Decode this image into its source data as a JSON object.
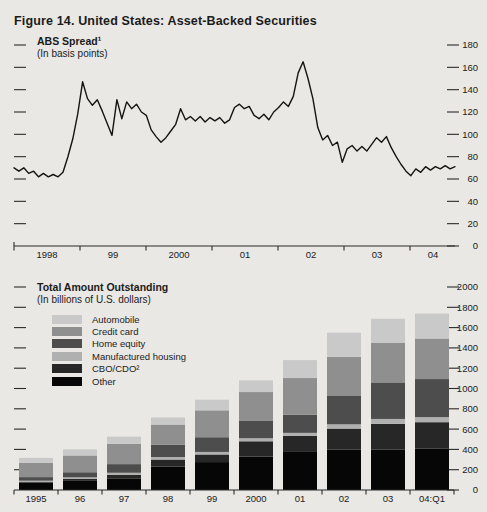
{
  "figure_title": "Figure 14. United States: Asset-Backed Securities",
  "colors": {
    "paper": "#e9e8e4",
    "ink": "#1b1b1b",
    "axis": "#2a2a2a"
  },
  "chart_data": [
    {
      "type": "line",
      "title": "ABS Spread¹",
      "subtitle": "(In basis points)",
      "x_axis": {
        "tick_labels": [
          "1998",
          "99",
          "2000",
          "01",
          "02",
          "03",
          "04"
        ]
      },
      "y_axis": {
        "side": "right",
        "ticks": [
          0,
          20,
          40,
          60,
          80,
          100,
          120,
          140,
          160,
          180
        ],
        "ylim": [
          0,
          180
        ],
        "grid": false
      },
      "series": [
        {
          "name": "ABS spread (basis points)",
          "color": "#141414",
          "values": [
            70,
            67,
            70,
            65,
            67,
            62,
            65,
            62,
            64,
            62,
            66,
            80,
            96,
            118,
            147,
            132,
            126,
            131,
            121,
            110,
            99,
            131,
            114,
            129,
            123,
            127,
            120,
            117,
            104,
            98,
            93,
            97,
            103,
            109,
            123,
            113,
            116,
            112,
            116,
            111,
            115,
            112,
            115,
            110,
            113,
            124,
            127,
            123,
            125,
            117,
            114,
            118,
            113,
            120,
            124,
            129,
            125,
            134,
            155,
            165,
            150,
            132,
            106,
            95,
            99,
            90,
            93,
            75,
            87,
            90,
            85,
            89,
            85,
            91,
            97,
            93,
            98,
            88,
            80,
            73,
            67,
            63,
            69,
            66,
            71,
            68,
            71,
            69,
            72,
            69,
            71
          ]
        }
      ]
    },
    {
      "type": "stacked-bar",
      "title": "Total Amount Outstanding",
      "subtitle": "(In billions of U.S. dollars)",
      "categories": [
        "1995",
        "96",
        "97",
        "98",
        "99",
        "2000",
        "01",
        "02",
        "03",
        "04:Q1"
      ],
      "y_axis": {
        "side": "right",
        "ticks": [
          0,
          200,
          400,
          600,
          800,
          1000,
          1200,
          1400,
          1600,
          1800,
          2000
        ],
        "ylim": [
          0,
          2000
        ],
        "grid": false
      },
      "series": [
        {
          "name": "Other",
          "color": "#060606",
          "values": [
            70,
            90,
            115,
            230,
            275,
            330,
            375,
            400,
            400,
            410
          ]
        },
        {
          "name": "CBO/CDO²",
          "color": "#272727",
          "values": [
            8,
            20,
            35,
            70,
            75,
            150,
            158,
            205,
            252,
            258
          ]
        },
        {
          "name": "Manufactured housing",
          "color": "#b0b0b0",
          "values": [
            14,
            15,
            20,
            25,
            25,
            30,
            30,
            42,
            48,
            50
          ]
        },
        {
          "name": "Home equity",
          "color": "#4d4d4d",
          "values": [
            35,
            50,
            85,
            120,
            145,
            170,
            180,
            285,
            360,
            375
          ]
        },
        {
          "name": "Credit card",
          "color": "#8f8f8f",
          "values": [
            140,
            165,
            200,
            200,
            265,
            285,
            360,
            380,
            392,
            400
          ]
        },
        {
          "name": "Automobile",
          "color": "#c9c9c9",
          "values": [
            50,
            60,
            70,
            70,
            105,
            115,
            177,
            238,
            235,
            245
          ]
        }
      ],
      "legend": [
        {
          "label": "Automobile"
        },
        {
          "label": "Credit card"
        },
        {
          "label": "Home equity"
        },
        {
          "label": "Manufactured housing"
        },
        {
          "label": "CBO/CDO²"
        },
        {
          "label": "Other"
        }
      ]
    }
  ]
}
